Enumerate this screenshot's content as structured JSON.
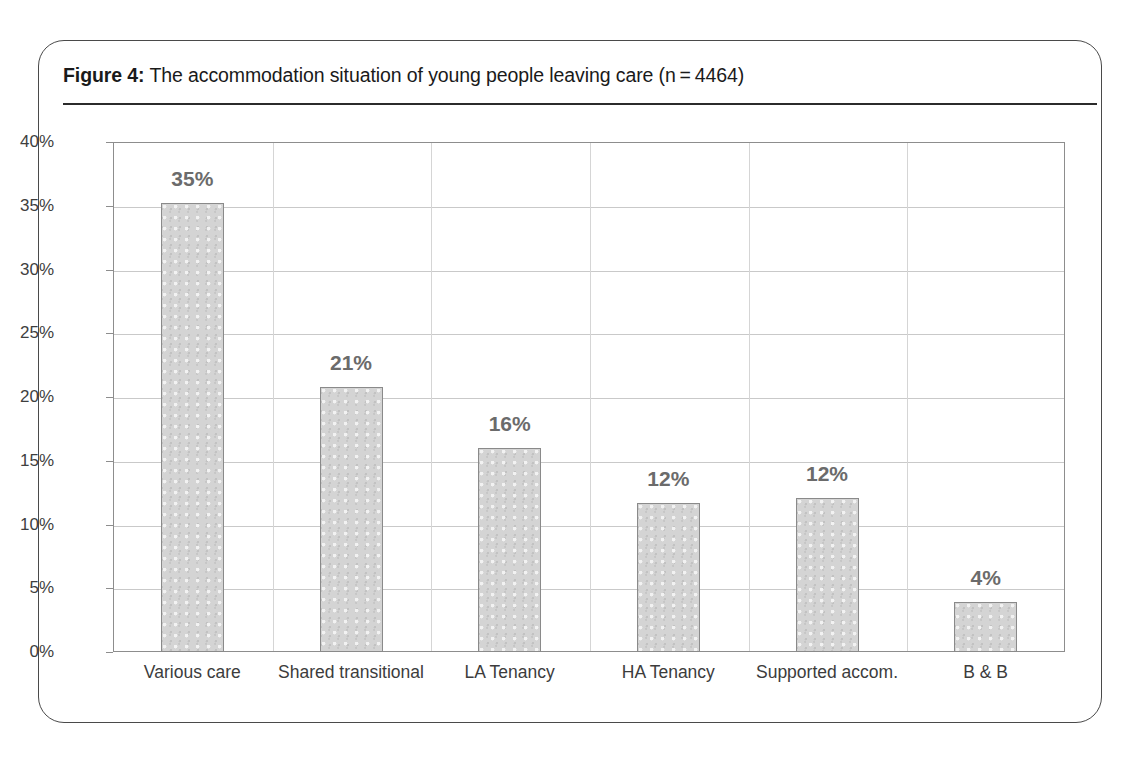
{
  "figure": {
    "label": "Figure 4:",
    "caption": " The accommodation situation of young people leaving care (n = 4464)"
  },
  "chart_data": {
    "type": "bar",
    "categories": [
      "Various care",
      "Shared transitional",
      "LA Tenancy",
      "HA Tenancy",
      "Supported accom.",
      "B & B"
    ],
    "values": [
      35.2,
      20.8,
      16.0,
      11.7,
      12.1,
      3.9
    ],
    "data_labels": [
      "35%",
      "21%",
      "16%",
      "12%",
      "12%",
      "4%"
    ],
    "xlabel": "",
    "ylabel": "",
    "ylim": [
      0,
      40
    ],
    "ytick_labels": [
      "40%",
      "35%",
      "30%",
      "25%",
      "20%",
      "15%",
      "10%",
      "5%",
      "0%"
    ],
    "ytick_values": [
      40,
      35,
      30,
      25,
      20,
      15,
      10,
      5,
      0
    ],
    "grid": true,
    "legend": false,
    "series_name": "Percentage of young people",
    "sample_size": 4464,
    "bar_fill": "#d4d4d4",
    "bar_border": "#8a8a8a",
    "label_color": "#6b6b6b",
    "axis_color": "#8d8d8d",
    "grid_color": "#c9c9c9"
  }
}
